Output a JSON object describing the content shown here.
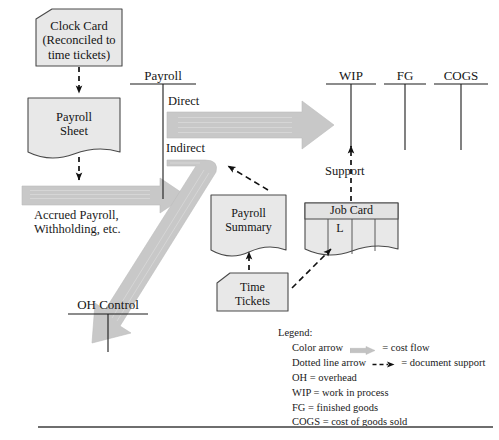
{
  "diagram": {
    "colors": {
      "flow_arrow": "#c8c8c8",
      "flow_arrow_edge": "#b0b0b0",
      "document_fill": "#e8e8e8",
      "document_stroke": "#4a4a4a",
      "line": "#1a1a1a",
      "bottom_rule": "#6e6e6e"
    }
  },
  "documents": [
    {
      "id": "clock-card",
      "lines": [
        "Clock Card",
        "(Reconciled to",
        "time tickets)"
      ]
    },
    {
      "id": "payroll-sheet",
      "lines": [
        "Payroll",
        "Sheet"
      ]
    },
    {
      "id": "payroll-summary",
      "lines": [
        "Payroll",
        "Summary"
      ]
    },
    {
      "id": "time-tickets",
      "lines": [
        "Time",
        "Tickets"
      ]
    },
    {
      "id": "job-card",
      "header": "Job Card",
      "cell": "L"
    }
  ],
  "accounts": [
    {
      "id": "payroll",
      "label": "Payroll"
    },
    {
      "id": "wip",
      "label": "WIP"
    },
    {
      "id": "fg",
      "label": "FG"
    },
    {
      "id": "cogs",
      "label": "COGS"
    },
    {
      "id": "oh-control",
      "label": "OH Control"
    }
  ],
  "flow_labels": {
    "direct": "Direct",
    "indirect": "Indirect",
    "support": "Support",
    "accrued": [
      "Accrued Payroll,",
      "Withholding, etc."
    ]
  },
  "legend": {
    "title": "Legend:",
    "items": [
      {
        "pre": "Color arrow",
        "icon": "color-arrow",
        "post": "= cost flow"
      },
      {
        "pre": "Dotted line arrow",
        "icon": "dotted-arrow",
        "post": "= document support"
      },
      {
        "pre": "OH = overhead",
        "icon": "",
        "post": ""
      },
      {
        "pre": "WIP = work in process",
        "icon": "",
        "post": ""
      },
      {
        "pre": "FG = finished goods",
        "icon": "",
        "post": ""
      },
      {
        "pre": "COGS = cost of goods sold",
        "icon": "",
        "post": ""
      }
    ]
  }
}
